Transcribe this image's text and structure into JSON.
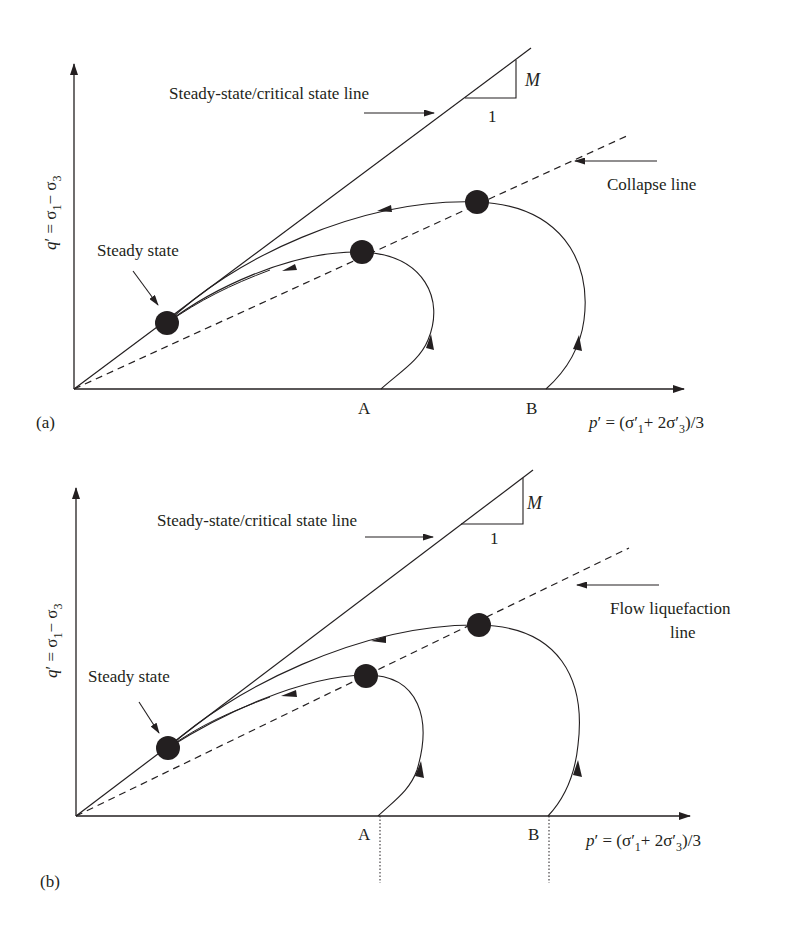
{
  "panels": [
    {
      "id": "a",
      "panel_label": "(a)",
      "y_axis_label": "q′ = σ′1 − σ′3",
      "y_axis": {
        "q": "q",
        "prime": "′",
        "eq": " = σ",
        "s1": "1",
        "minus": "− σ",
        "s3": "3"
      },
      "x_axis": {
        "p": "p",
        "rest": "′ = (σ′",
        "s1": "1",
        "mid": "+ 2σ′",
        "s3": "3",
        "end": ")/3"
      },
      "x_axis_label": "p′ = (σ′1 + 2σ′3)/3",
      "csl_label": "Steady-state/critical state line",
      "slope_M": "M",
      "slope_run": "1",
      "second_line_label_line1": "Collapse line",
      "second_line_label_line2": "",
      "steady_state_label": "Steady state",
      "point_A": "A",
      "point_B": "B"
    },
    {
      "id": "b",
      "panel_label": "(b)",
      "y_axis_label": "q′ = σ′1 − σ′3",
      "y_axis": {
        "q": "q",
        "prime": "′",
        "eq": " = σ",
        "s1": "1",
        "minus": "− σ",
        "s3": "3"
      },
      "x_axis": {
        "p": "p",
        "rest": "′ = (σ′",
        "s1": "1",
        "mid": "+ 2σ′",
        "s3": "3",
        "end": ")/3"
      },
      "x_axis_label": "p′ = (σ′1 + 2σ′3)/3",
      "csl_label": "Steady-state/critical state line",
      "slope_M": "M",
      "slope_run": "1",
      "second_line_label_line1": "Flow liquefaction",
      "second_line_label_line2": "line",
      "steady_state_label": "Steady state",
      "point_A": "A",
      "point_B": "B"
    }
  ],
  "colors": {
    "ink": "#231f20",
    "background": "#ffffff"
  }
}
